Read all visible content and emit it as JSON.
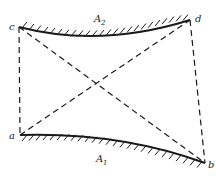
{
  "diagram": {
    "points": {
      "a": {
        "label": "a",
        "x": 20,
        "y": 135
      },
      "b": {
        "label": "b",
        "x": 205,
        "y": 163
      },
      "c": {
        "label": "c",
        "x": 19,
        "y": 27
      },
      "d": {
        "label": "d",
        "x": 190,
        "y": 20
      }
    },
    "surfaces": {
      "upper": {
        "label": "A",
        "subscript": "2"
      },
      "lower": {
        "label": "A",
        "subscript": "1"
      }
    },
    "dashed_lines": [
      "c-a",
      "d-b",
      "c-b",
      "a-d"
    ],
    "colors": {
      "line": "#1a1a1a",
      "background": "#ffffff"
    }
  }
}
